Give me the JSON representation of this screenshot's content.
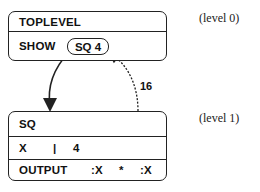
{
  "diagram": {
    "level0": {
      "title": "TOPLEVEL",
      "command": "SHOW",
      "call": "SQ 4",
      "label": "(level 0)"
    },
    "level1": {
      "title": "SQ",
      "binding": {
        "name": "X",
        "sep": "|",
        "value": "4"
      },
      "body": {
        "command": "OUTPUT",
        "arg1": ":X",
        "op": "*",
        "arg2": ":X"
      },
      "label": "(level 1)"
    },
    "return_value": "16"
  },
  "colors": {
    "stroke": "#222222",
    "background": "#ffffff"
  }
}
